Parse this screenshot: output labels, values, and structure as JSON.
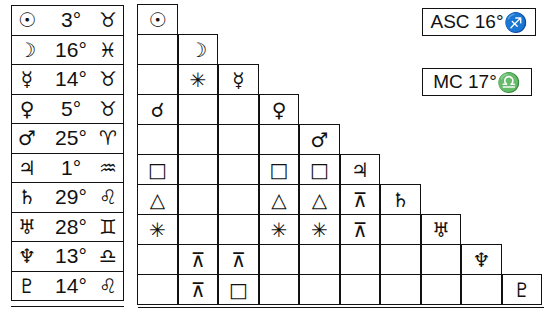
{
  "planets_table": [
    {
      "planet": "☉",
      "planet_name": "sun",
      "degree": "3°",
      "sign": "♉",
      "sign_name": "taurus"
    },
    {
      "planet": "☽",
      "planet_name": "moon",
      "degree": "16°",
      "sign": "♓",
      "sign_name": "pisces"
    },
    {
      "planet": "☿",
      "planet_name": "mercury",
      "degree": "14°",
      "sign": "♉",
      "sign_name": "taurus"
    },
    {
      "planet": "♀",
      "planet_name": "venus",
      "degree": "5°",
      "sign": "♉",
      "sign_name": "taurus"
    },
    {
      "planet": "♂",
      "planet_name": "mars",
      "degree": "25°",
      "sign": "♈",
      "sign_name": "aries"
    },
    {
      "planet": "♃",
      "planet_name": "jupiter",
      "degree": "1°",
      "sign": "♒",
      "sign_name": "aquarius"
    },
    {
      "planet": "♄",
      "planet_name": "saturn",
      "degree": "29°",
      "sign": "♌",
      "sign_name": "leo"
    },
    {
      "planet": "♅",
      "planet_name": "uranus",
      "degree": "28°",
      "sign": "♊",
      "sign_name": "gemini"
    },
    {
      "planet": "♆",
      "planet_name": "neptune",
      "degree": "13°",
      "sign": "♎",
      "sign_name": "libra"
    },
    {
      "planet": "♇",
      "planet_name": "pluto",
      "degree": "14°",
      "sign": "♌",
      "sign_name": "leo"
    }
  ],
  "aspect_grid": {
    "diagonal": [
      "☉",
      "☽",
      "☿",
      "♀",
      "♂",
      "♃",
      "♄",
      "♅",
      "♆",
      "♇"
    ],
    "rows": [
      [],
      [
        ""
      ],
      [
        "",
        "✳"
      ],
      [
        "☌",
        "",
        ""
      ],
      [
        "",
        "",
        "",
        ""
      ],
      [
        "□",
        "",
        "",
        "□",
        "□"
      ],
      [
        "△",
        "",
        "",
        "△",
        "△",
        "⊼"
      ],
      [
        "✳",
        "",
        "",
        "✳",
        "✳",
        "⊼",
        ""
      ],
      [
        "",
        "⊼",
        "⊼",
        "",
        "",
        "",
        "",
        ""
      ],
      [
        "",
        "⊼",
        "□",
        "",
        "",
        "",
        "",
        "",
        ""
      ]
    ]
  },
  "angles": {
    "asc": {
      "label": "ASC 16°",
      "sign": "♐"
    },
    "mc": {
      "label": "MC 17°",
      "sign": "♎"
    }
  }
}
